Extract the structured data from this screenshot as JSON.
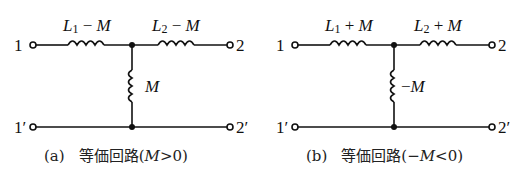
{
  "circuits": [
    {
      "id": "a",
      "port_in_top": "1",
      "port_in_bottom": "1′",
      "port_out_top": "2",
      "port_out_bottom": "2′",
      "left_inductor": {
        "L": "L",
        "sub": "1",
        "op": " − ",
        "M": "M"
      },
      "right_inductor": {
        "L": "L",
        "sub": "2",
        "op": " − ",
        "M": "M"
      },
      "shunt_inductor": {
        "prefix": "",
        "M": "M"
      },
      "caption": {
        "tag": "(a)",
        "text": "等価回路(",
        "M": "M",
        "cond": ">0)"
      }
    },
    {
      "id": "b",
      "port_in_top": "1",
      "port_in_bottom": "1′",
      "port_out_top": "2",
      "port_out_bottom": "2′",
      "left_inductor": {
        "L": "L",
        "sub": "1",
        "op": " + ",
        "M": "M"
      },
      "right_inductor": {
        "L": "L",
        "sub": "2",
        "op": " + ",
        "M": "M"
      },
      "shunt_inductor": {
        "prefix": "−",
        "M": "M"
      },
      "caption": {
        "tag": "(b)",
        "text": "等価回路(−",
        "M": "M",
        "cond": "<0)"
      }
    }
  ],
  "colors": {
    "wire": "#111111",
    "background": "#ffffff"
  }
}
